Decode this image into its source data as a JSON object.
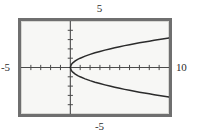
{
  "chart_data": {
    "type": "line",
    "title": "",
    "subtitle": "",
    "xlabel": "",
    "ylabel": "",
    "grid": false,
    "legend": null,
    "legend_position": "none",
    "xlim": [
      -5,
      10
    ],
    "ylim": [
      -5,
      5
    ],
    "xticks": [
      -5,
      -4,
      -3,
      -2,
      -1,
      0,
      1,
      2,
      3,
      4,
      5,
      6,
      7,
      8,
      9,
      10
    ],
    "yticks": [
      -5,
      -4,
      -3,
      -2,
      -1,
      0,
      1,
      2,
      3,
      4,
      5
    ],
    "tick_interval": 1,
    "axis_labels_shown": [
      "5",
      "-5",
      "-5",
      "10"
    ],
    "series": [
      {
        "name": "upper-branch",
        "comment": "y = sqrt(x), upper half of sideways parabola x = y^2",
        "x": [
          0,
          0.1,
          0.25,
          0.5,
          0.75,
          1,
          1.5,
          2,
          2.5,
          3,
          3.5,
          4,
          4.5,
          5,
          5.5,
          6,
          6.5,
          7,
          7.5,
          8,
          8.5,
          9,
          9.5,
          10
        ],
        "y": [
          0,
          0.32,
          0.5,
          0.71,
          0.87,
          1,
          1.22,
          1.41,
          1.58,
          1.73,
          1.87,
          2,
          2.12,
          2.24,
          2.35,
          2.45,
          2.55,
          2.65,
          2.74,
          2.83,
          2.92,
          3,
          3.08,
          3.16
        ]
      },
      {
        "name": "lower-branch",
        "comment": "y = -sqrt(x), lower half of sideways parabola x = y^2",
        "x": [
          0,
          0.1,
          0.25,
          0.5,
          0.75,
          1,
          1.5,
          2,
          2.5,
          3,
          3.5,
          4,
          4.5,
          5,
          5.5,
          6,
          6.5,
          7,
          7.5,
          8,
          8.5,
          9,
          9.5,
          10
        ],
        "y": [
          0,
          -0.32,
          -0.5,
          -0.71,
          -0.87,
          -1,
          -1.22,
          -1.41,
          -1.58,
          -1.73,
          -1.87,
          -2,
          -2.12,
          -2.24,
          -2.35,
          -2.45,
          -2.55,
          -2.65,
          -2.74,
          -2.83,
          -2.92,
          -3,
          -3.08,
          -3.16
        ]
      }
    ],
    "vertex": [
      0,
      0
    ],
    "colors": {
      "curve": "#2b2b2b",
      "axis": "#4a4a4a",
      "frame": "#6f6f6f",
      "plot_background": "#f7f7f5",
      "page_background": "#ffffff",
      "label_text": "#2b2b2b"
    }
  },
  "labels": {
    "top": "5",
    "bottom": "-5",
    "left": "-5",
    "right": "10"
  }
}
